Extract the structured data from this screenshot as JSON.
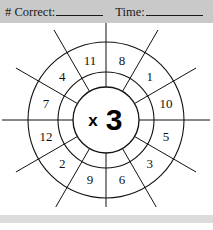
{
  "worksheet": {
    "title": "Multiplication Wheel Worksheet",
    "header": {
      "correct_label": "# Correct:",
      "correct_value": "",
      "time_label": "Time:",
      "time_value": ""
    },
    "wheel": {
      "hub_operator": "x",
      "hub_multiplier": "3",
      "hub_label": "x3",
      "sector_count": 12,
      "outer_numbers_clockwise_from_top_right": [
        "8",
        "1",
        "10",
        "5",
        "3",
        "6",
        "9",
        "2",
        "12",
        "7",
        "4",
        "11"
      ],
      "sectors": [
        {
          "position": "top-right",
          "value": "8"
        },
        {
          "position": "upper-right",
          "value": "1"
        },
        {
          "position": "right-upper",
          "value": "10"
        },
        {
          "position": "right-lower",
          "value": "5"
        },
        {
          "position": "lower-right",
          "value": "3"
        },
        {
          "position": "bottom-right",
          "value": "6"
        },
        {
          "position": "bottom-left",
          "value": "9"
        },
        {
          "position": "lower-left",
          "value": "2"
        },
        {
          "position": "left-lower",
          "value": "12"
        },
        {
          "position": "left-upper",
          "value": "7"
        },
        {
          "position": "upper-left",
          "value": "4"
        },
        {
          "position": "top-left",
          "value": "11"
        }
      ]
    },
    "colors": {
      "header_band": "#c9c9c9",
      "footer_band": "#dcdcdc",
      "ink": "#111111",
      "paper": "#ffffff"
    }
  }
}
